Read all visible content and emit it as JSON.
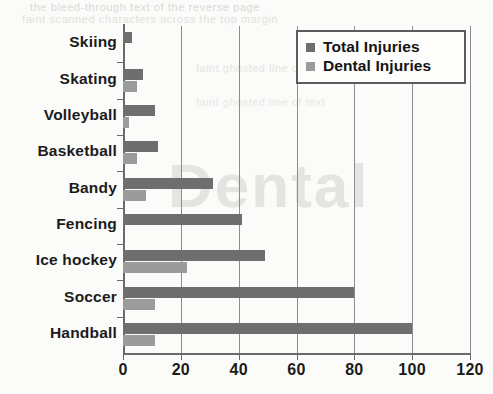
{
  "chart_data": {
    "type": "bar",
    "orientation": "horizontal",
    "title": "",
    "xlabel": "",
    "ylabel": "",
    "categories": [
      "Skiing",
      "Skating",
      "Volleyball",
      "Basketball",
      "Bandy",
      "Fencing",
      "Ice hockey",
      "Soccer",
      "Handball"
    ],
    "series": [
      {
        "name": "Total Injuries",
        "color": "#6e6e6e",
        "values": [
          3,
          7,
          11,
          12,
          31,
          41,
          49,
          80,
          100
        ]
      },
      {
        "name": "Dental Injuries",
        "color": "#9b9b9b",
        "values": [
          0,
          5,
          2,
          5,
          8,
          0,
          22,
          11,
          11
        ]
      }
    ],
    "xlim": [
      0,
      120
    ],
    "xticks": [
      0,
      20,
      40,
      60,
      80,
      100,
      120
    ],
    "xtick_labels": [
      "0",
      "20",
      "40",
      "60",
      "80",
      "100",
      "120"
    ],
    "grid": "vertical",
    "legend_position": "top-right"
  },
  "legend": {
    "items": [
      {
        "label": "Total Injuries",
        "color": "#6e6e6e"
      },
      {
        "label": "Dental Injuries",
        "color": "#9b9b9b"
      }
    ]
  },
  "artifacts": {
    "bleed_top_line1": "the bleed-through text of the reverse page",
    "bleed_top_line2": "faint scanned characters across the top margin",
    "bleed_mid_line1": "faint ghosted line of text",
    "bleed_mid_line2": "faint ghosted line of text",
    "bleed_big": "Dental"
  }
}
